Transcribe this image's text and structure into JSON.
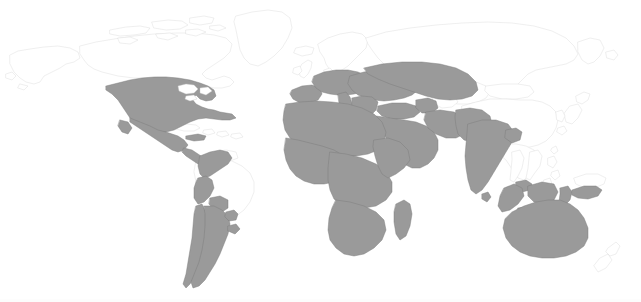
{
  "map": {
    "title": "World Map",
    "type": "choropleth-binary",
    "projection": "equirectangular",
    "width": 641,
    "height": 302,
    "background_color": "#ffffff",
    "highlight_fill": "#9a9a9a",
    "highlight_stroke": "#7b7b7b",
    "unhighlighted_fill": "#ffffff",
    "unhighlighted_stroke": "#dcdcdc",
    "legend_visible": false,
    "labels_visible": false,
    "graticule_visible": false,
    "highlighted_regions": [
      "United States",
      "Mexico",
      "Guatemala",
      "Belize",
      "Honduras",
      "El Salvador",
      "Nicaragua",
      "Costa Rica",
      "Panama",
      "Cuba",
      "Dominican Republic",
      "Colombia",
      "Venezuela",
      "Ecuador",
      "Peru",
      "Bolivia",
      "Chile",
      "Argentina",
      "Uruguay",
      "Paraguay",
      "Portugal",
      "Spain",
      "France",
      "Italy",
      "Germany",
      "Poland",
      "Austria",
      "Switzerland",
      "Belgium",
      "Netherlands",
      "Czechia",
      "Slovakia",
      "Hungary",
      "Romania",
      "Bulgaria",
      "Greece",
      "Serbia",
      "Croatia",
      "Bosnia and Herzegovina",
      "Albania",
      "North Macedonia",
      "Ukraine",
      "Belarus",
      "Moldova",
      "Lithuania",
      "Latvia",
      "Estonia",
      "Turkey",
      "Georgia",
      "Armenia",
      "Azerbaijan",
      "Syria",
      "Lebanon",
      "Israel",
      "Jordan",
      "Iraq",
      "Iran",
      "Saudi Arabia",
      "Yemen",
      "Oman",
      "United Arab Emirates",
      "Qatar",
      "Kuwait",
      "Afghanistan",
      "Pakistan",
      "India",
      "Nepal",
      "Bangladesh",
      "Sri Lanka",
      "Morocco",
      "Algeria",
      "Tunisia",
      "Libya",
      "Egypt",
      "Western Sahara",
      "Mauritania",
      "Mali",
      "Niger",
      "Chad",
      "Sudan",
      "South Sudan",
      "Eritrea",
      "Ethiopia",
      "Somalia",
      "Djibouti",
      "Senegal",
      "Gambia",
      "Guinea",
      "Guinea-Bissau",
      "Sierra Leone",
      "Liberia",
      "Ivory Coast",
      "Ghana",
      "Togo",
      "Benin",
      "Burkina Faso",
      "Nigeria",
      "Cameroon",
      "Central African Republic",
      "Equatorial Guinea",
      "Gabon",
      "Republic of the Congo",
      "Democratic Republic of the Congo",
      "Uganda",
      "Kenya",
      "Rwanda",
      "Burundi",
      "Tanzania",
      "Angola",
      "Zambia",
      "Malawi",
      "Mozambique",
      "Zimbabwe",
      "Botswana",
      "Namibia",
      "South Africa",
      "Lesotho",
      "Eswatini",
      "Madagascar",
      "Malaysia",
      "Indonesia",
      "Brunei",
      "Australia"
    ],
    "unhighlighted_regions": [
      "Canada",
      "Alaska",
      "Greenland",
      "Iceland",
      "Norway",
      "Sweden",
      "Finland",
      "United Kingdom",
      "Ireland",
      "Denmark",
      "Russia",
      "Kazakhstan",
      "Uzbekistan",
      "Turkmenistan",
      "Kyrgyzstan",
      "Tajikistan",
      "Mongolia",
      "China",
      "Japan",
      "North Korea",
      "South Korea",
      "Taiwan",
      "Myanmar",
      "Thailand",
      "Laos",
      "Vietnam",
      "Cambodia",
      "Philippines",
      "Papua New Guinea",
      "New Zealand",
      "Brazil",
      "Guyana",
      "Suriname",
      "French Guiana",
      "Antarctica"
    ]
  }
}
